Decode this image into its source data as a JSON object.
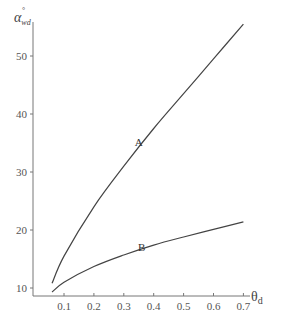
{
  "chart_data": {
    "type": "line",
    "title": "",
    "xlabel": "θd",
    "ylabel": "α°wd",
    "xlim": [
      0.0,
      0.75
    ],
    "ylim": [
      8.8,
      57
    ],
    "x_ticks": [
      0.1,
      0.2,
      0.3,
      0.4,
      0.5,
      0.6,
      0.7
    ],
    "x_tick_labels": [
      "0.1",
      "0.2",
      "0.3",
      "0.4",
      "0.5",
      "0.6",
      "0.7"
    ],
    "y_ticks": [
      10,
      20,
      30,
      40,
      50
    ],
    "y_tick_labels": [
      "10",
      "20",
      "30",
      "40",
      "50"
    ],
    "grid": false,
    "legend": "none (inline curve labels)",
    "series": [
      {
        "name": "A",
        "x": [
          0.06,
          0.1,
          0.2,
          0.3,
          0.4,
          0.5,
          0.6,
          0.7
        ],
        "values": [
          10.8,
          15.5,
          24.0,
          31.0,
          37.5,
          43.5,
          49.5,
          55.5
        ]
      },
      {
        "name": "B",
        "x": [
          0.06,
          0.1,
          0.2,
          0.3,
          0.4,
          0.5,
          0.6,
          0.7
        ],
        "values": [
          9.3,
          11.0,
          13.7,
          15.7,
          17.4,
          18.8,
          20.1,
          21.4
        ]
      }
    ],
    "annotations": [
      {
        "text": "A",
        "x": 0.35,
        "y": 34.5
      },
      {
        "text": "B",
        "x": 0.36,
        "y": 16.3
      }
    ]
  },
  "labels": {
    "y_axis_main": "α",
    "y_axis_sup": "°",
    "y_axis_sub": "wd",
    "x_axis_main": "θ",
    "x_axis_sub": "d"
  }
}
